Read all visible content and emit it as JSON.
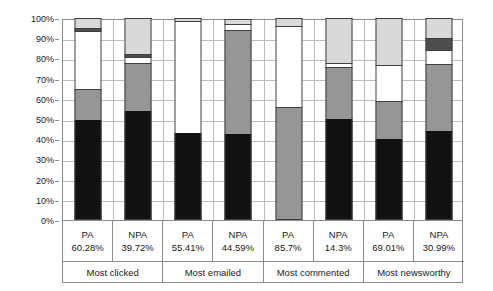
{
  "chart_data": {
    "type": "bar",
    "subtype": "stacked-100-percent",
    "title": "",
    "xlabel": "",
    "ylabel": "",
    "ylim": [
      0,
      100
    ],
    "ytick_labels": [
      "0%",
      "10%",
      "20%",
      "30%",
      "40%",
      "50%",
      "60%",
      "70%",
      "80%",
      "90%",
      "100%"
    ],
    "ytick_values": [
      0,
      10,
      20,
      30,
      40,
      50,
      60,
      70,
      80,
      90,
      100
    ],
    "grid": true,
    "legend": "none",
    "categories": [
      "PA",
      "NPA",
      "PA",
      "NPA",
      "PA",
      "NPA",
      "PA",
      "NPA"
    ],
    "group_labels": [
      "Most clicked",
      "Most emailed",
      "Most commented",
      "Most newsworthy"
    ],
    "category_percents": [
      "60.28%",
      "39.72%",
      "55.41%",
      "44.59%",
      "85.7%",
      "14.3%",
      "69.01%",
      "30.99%"
    ],
    "series": [
      {
        "name": "segment-1",
        "color": "#111111",
        "values": [
          49.5,
          54.0,
          43.0,
          42.5,
          0.0,
          50.0,
          40.0,
          44.0
        ]
      },
      {
        "name": "segment-2",
        "color": "#969696",
        "values": [
          15.5,
          23.5,
          0.0,
          51.5,
          56.0,
          25.5,
          19.0,
          33.0
        ]
      },
      {
        "name": "segment-3",
        "color": "#ffffff",
        "values": [
          28.5,
          3.0,
          55.5,
          3.0,
          40.0,
          2.0,
          17.5,
          7.0
        ]
      },
      {
        "name": "segment-4",
        "color": "#4d4d4d",
        "values": [
          1.5,
          1.5,
          0.0,
          0.0,
          0.0,
          0.0,
          0.0,
          6.0
        ]
      },
      {
        "name": "segment-5",
        "color": "#d9d9d9",
        "values": [
          5.0,
          18.0,
          1.5,
          2.5,
          4.0,
          22.5,
          23.5,
          10.0
        ]
      }
    ],
    "bars": [
      {
        "label": "PA",
        "percent": "60.28%",
        "group": "Most clicked",
        "segments": [
          49.5,
          15.5,
          28.5,
          1.5,
          5.0
        ]
      },
      {
        "label": "NPA",
        "percent": "39.72%",
        "group": "Most clicked",
        "segments": [
          54.0,
          23.5,
          3.0,
          1.5,
          18.0
        ]
      },
      {
        "label": "PA",
        "percent": "55.41%",
        "group": "Most emailed",
        "segments": [
          43.0,
          0.0,
          55.5,
          0.0,
          1.5
        ]
      },
      {
        "label": "NPA",
        "percent": "44.59%",
        "group": "Most emailed",
        "segments": [
          42.5,
          51.5,
          3.0,
          0.0,
          2.5
        ]
      },
      {
        "label": "PA",
        "percent": "85.7%",
        "group": "Most commented",
        "segments": [
          0.0,
          56.0,
          40.0,
          0.0,
          4.0
        ]
      },
      {
        "label": "NPA",
        "percent": "14.3%",
        "group": "Most commented",
        "segments": [
          50.0,
          25.5,
          2.0,
          0.0,
          22.5
        ]
      },
      {
        "label": "PA",
        "percent": "69.01%",
        "group": "Most newsworthy",
        "segments": [
          40.0,
          19.0,
          17.5,
          0.0,
          23.5
        ]
      },
      {
        "label": "NPA",
        "percent": "30.99%",
        "group": "Most newsworthy",
        "segments": [
          44.0,
          33.0,
          7.0,
          6.0,
          10.0
        ]
      }
    ],
    "colors": {
      "segment_1": "#111111",
      "segment_2": "#969696",
      "segment_3": "#ffffff",
      "segment_4": "#4d4d4d",
      "segment_5": "#d9d9d9",
      "grid": "#bdbdbd",
      "axis": "#8c8c8c",
      "text": "#1a1a1a"
    }
  }
}
